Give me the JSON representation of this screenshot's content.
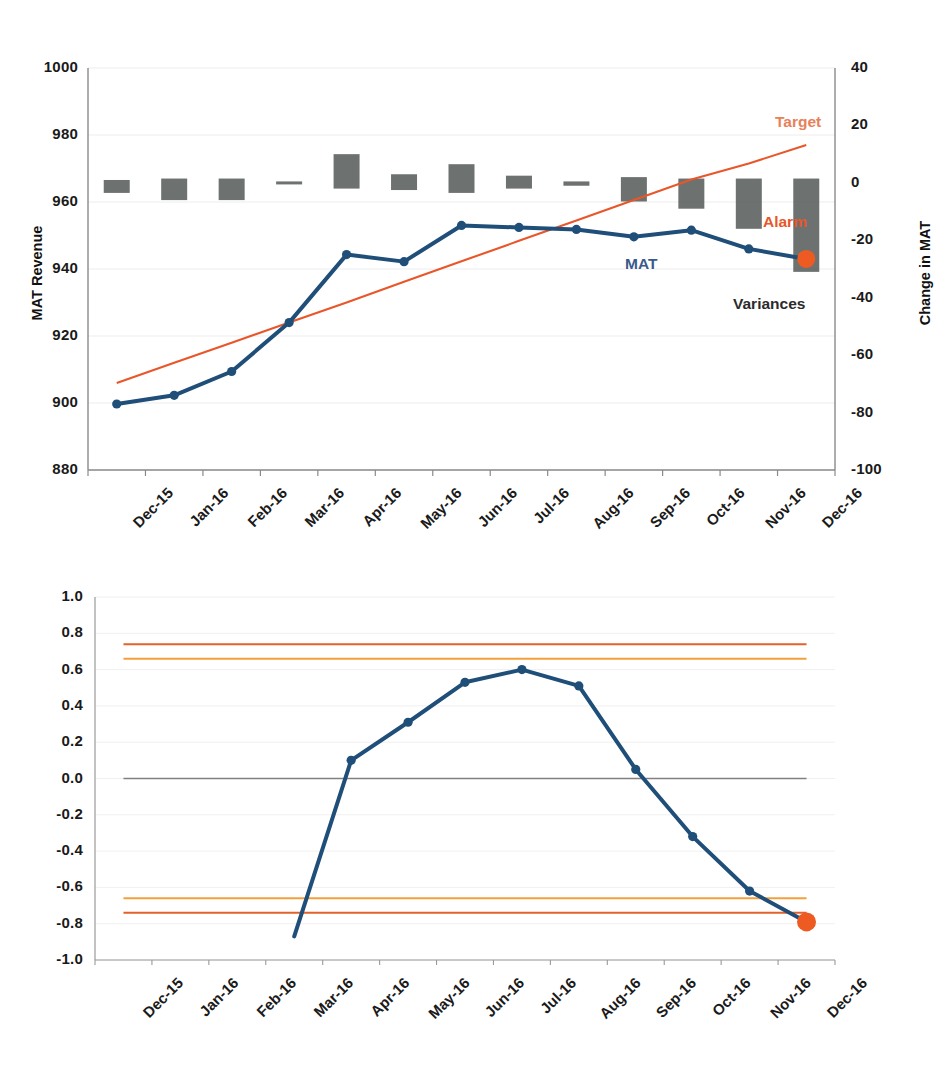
{
  "chart_data": [
    {
      "type": "line",
      "id": "mat-revenue-chart",
      "title": "",
      "xlabel": "",
      "ylabel": "MAT Revenue",
      "y2label": "Change in MAT",
      "categories": [
        "Dec-15",
        "Jan-16",
        "Feb-16",
        "Mar-16",
        "Apr-16",
        "May-16",
        "Jun-16",
        "Jul-16",
        "Aug-16",
        "Sep-16",
        "Oct-16",
        "Nov-16",
        "Dec-16"
      ],
      "ylim": [
        880,
        1000
      ],
      "yticks": [
        "880",
        "900",
        "920",
        "940",
        "960",
        "980",
        "1000"
      ],
      "y2lim": [
        -100,
        40
      ],
      "y2ticks": [
        "-100",
        "-80",
        "-60",
        "-40",
        "-20",
        "0",
        "20",
        "40"
      ],
      "grid": true,
      "legend_position": "inline-annotations",
      "annotations": [
        {
          "name": "target-label",
          "text": "Target",
          "color": "#e8805a"
        },
        {
          "name": "alarm-label",
          "text": "Alarm",
          "color": "#e8562a"
        },
        {
          "name": "mat-label",
          "text": "MAT",
          "color": "#3a5a8c"
        },
        {
          "name": "variances-label",
          "text": "Variances",
          "color": "#2b2b2b"
        }
      ],
      "series": [
        {
          "name": "MAT",
          "type": "line",
          "color": "#1f4e79",
          "axis": "left",
          "values": [
            899.7,
            902.3,
            909.4,
            924.0,
            944.3,
            942.2,
            953.0,
            952.4,
            951.8,
            949.6,
            951.6,
            946.0,
            943.0
          ],
          "last_point_alarm": true,
          "alarm_color": "#ed5b22"
        },
        {
          "name": "Target",
          "type": "line",
          "color": "#e8562a",
          "axis": "left",
          "values": [
            906.0,
            912.0,
            918.0,
            924.0,
            930.0,
            936.2,
            942.3,
            948.4,
            954.5,
            960.6,
            966.7,
            971.5,
            977.0
          ]
        },
        {
          "name": "Variances",
          "type": "floating-bar",
          "color": "#595e5c",
          "axis": "right",
          "low": [
            -3.5,
            -6.0,
            -6.0,
            -0.5,
            -2.0,
            -2.5,
            -3.5,
            -2.0,
            -1.0,
            -6.5,
            -9.0,
            -16.0,
            -31.0
          ],
          "high": [
            1.0,
            1.5,
            1.5,
            0.5,
            10.0,
            3.0,
            6.5,
            2.5,
            0.5,
            2.0,
            1.5,
            1.5,
            1.5
          ]
        }
      ]
    },
    {
      "type": "line",
      "id": "normalised-variance-chart",
      "title": "",
      "xlabel": "",
      "ylabel": "",
      "categories": [
        "Dec-15",
        "Jan-16",
        "Feb-16",
        "Mar-16",
        "Apr-16",
        "May-16",
        "Jun-16",
        "Jul-16",
        "Aug-16",
        "Sep-16",
        "Oct-16",
        "Nov-16",
        "Dec-16"
      ],
      "ylim": [
        -1.0,
        1.0
      ],
      "yticks": [
        "-1.0",
        "-0.8",
        "-0.6",
        "-0.4",
        "-0.2",
        "0.0",
        "0.2",
        "0.4",
        "0.6",
        "0.8",
        "1.0"
      ],
      "grid": true,
      "legend_position": "none",
      "series": [
        {
          "name": "Normalised variance",
          "type": "line",
          "color": "#1f4e79",
          "values": [
            null,
            null,
            null,
            -0.87,
            0.1,
            0.31,
            0.53,
            0.6,
            0.51,
            0.05,
            -0.32,
            -0.62,
            -0.79
          ],
          "last_point_alarm": true,
          "alarm_color": "#ed5b22"
        }
      ],
      "reference_lines": [
        {
          "name": "upper-outer-limit",
          "value": 0.74,
          "color": "#e2622c"
        },
        {
          "name": "upper-inner-limit",
          "value": 0.66,
          "color": "#f2a03c"
        },
        {
          "name": "zero-line",
          "value": 0.0,
          "color": "#808080"
        },
        {
          "name": "lower-inner-limit",
          "value": -0.66,
          "color": "#f2a03c"
        },
        {
          "name": "lower-outer-limit",
          "value": -0.74,
          "color": "#e2622c"
        }
      ]
    }
  ]
}
